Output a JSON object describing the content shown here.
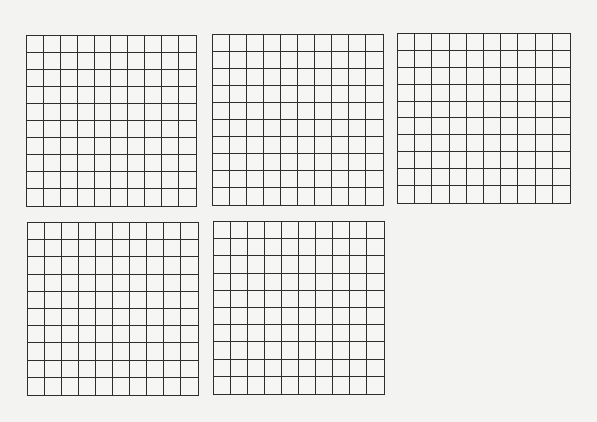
{
  "line_color": "#2e2e2e",
  "background_color": "#f3f3f2",
  "grids": [
    {
      "id": "grid-1",
      "rows": 10,
      "cols": 10,
      "x": 26,
      "y": 35,
      "w": 171,
      "h": 172
    },
    {
      "id": "grid-2",
      "rows": 10,
      "cols": 10,
      "x": 212,
      "y": 34,
      "w": 172,
      "h": 172
    },
    {
      "id": "grid-3",
      "rows": 10,
      "cols": 10,
      "x": 397,
      "y": 33,
      "w": 174,
      "h": 171
    },
    {
      "id": "grid-4",
      "rows": 10,
      "cols": 10,
      "x": 27,
      "y": 222,
      "w": 172,
      "h": 174
    },
    {
      "id": "grid-5",
      "rows": 10,
      "cols": 10,
      "x": 213,
      "y": 221,
      "w": 172,
      "h": 174
    }
  ]
}
